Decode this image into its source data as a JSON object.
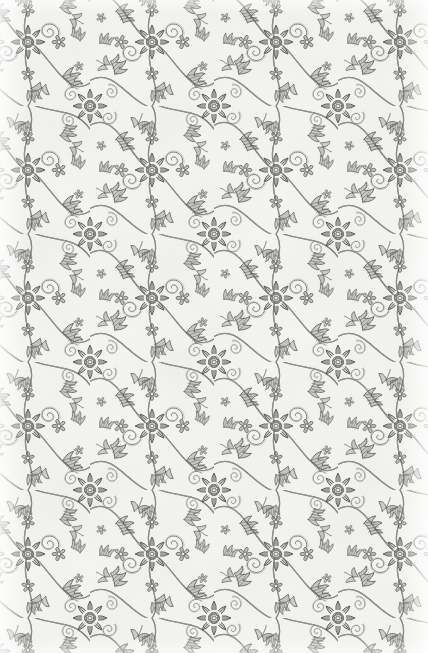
{
  "sheet": {
    "kind": "decorative-damask-endpaper",
    "width_px": 428,
    "height_px": 653,
    "description": "Scanned floral damask / brocade endpaper: gray engraved scrolling foliage and rosettes printed on off-white paper.",
    "alt_text": "Dense gray floral damask pattern of eight-petal rosettes linked by scrolling acanthus vines and curled tendrils on white paper"
  },
  "palette": {
    "paper": "#f7f7f4",
    "paper_highlight": "#fdfdfb",
    "ink": "#7a7a78",
    "ink_dark": "#5e5e5d",
    "ink_light": "#a6a6a3",
    "ink_pale": "#c6c6c3",
    "rosette_center": "#efefec"
  },
  "pattern": {
    "name": "half-drop floral damask",
    "repeat_type": "half-drop",
    "tile_width_px": 124,
    "tile_height_px": 128,
    "drop_offset_px": 64,
    "origin_offset_x_px": 34,
    "origin_offset_y_px": 22,
    "stroke_width_px": 1,
    "motifs": [
      {
        "id": "rosette",
        "label": "eight-petal rosette",
        "petal_count": 8,
        "inner_petal_count": 8,
        "outer_radius_px": 17,
        "inner_radius_px": 9,
        "core_radius_px": 4,
        "centers_per_tile": 2
      },
      {
        "id": "acanthus-leaf",
        "label": "scrolling acanthus leaf",
        "lobe_count": 4
      },
      {
        "id": "tendril-scroll",
        "label": "curled tendril scroll",
        "turns": 1.6
      },
      {
        "id": "floret",
        "label": "small five-petal floret",
        "petal_count": 5,
        "radius_px": 7
      },
      {
        "id": "bud-spray",
        "label": "three-lobed bud spray"
      }
    ]
  },
  "edges": {
    "left_margin_label": "bleached left margin",
    "right_margin_label": "bleached right margin",
    "top_edge_label": "cropped top edge",
    "bottom_edge_label": "cropped bottom edge",
    "margin_width_px": 26
  }
}
